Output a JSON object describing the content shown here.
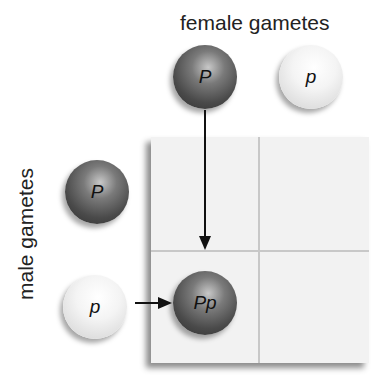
{
  "labels": {
    "female": "female gametes",
    "male": "male gametes"
  },
  "female_gametes": [
    {
      "allele": "P",
      "shade": "dark"
    },
    {
      "allele": "p",
      "shade": "light"
    }
  ],
  "male_gametes": [
    {
      "allele": "P",
      "shade": "dark"
    },
    {
      "allele": "p",
      "shade": "light"
    }
  ],
  "punnett": {
    "rows": 2,
    "cols": 2,
    "filled_cells": [
      {
        "row": 1,
        "col": 0,
        "genotype": "Pp",
        "shade": "dark"
      }
    ]
  },
  "colors": {
    "grid_bg": "#f2f2f2",
    "grid_line": "#c8c8c8",
    "dark_ball": "#4a4a4a",
    "light_ball": "#f4f4f4",
    "arrow": "#111111"
  }
}
